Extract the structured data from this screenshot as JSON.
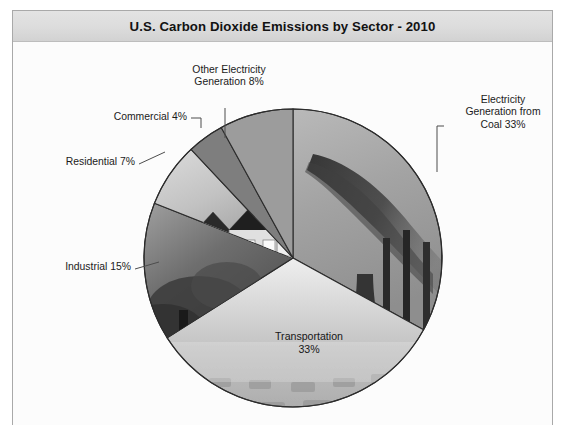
{
  "figure": {
    "title": "U.S. Carbon Dioxide Emissions by Sector - 2010",
    "background_color": "#ffffff",
    "frame_color": "#a9a9a9",
    "title_band_color": "#dcdcdc"
  },
  "chart_data": {
    "type": "pie",
    "title": "U.S. Carbon Dioxide Emissions by Sector - 2010",
    "xlabel": "",
    "ylabel": "",
    "units": "percent",
    "total": 100,
    "legend_position": "none",
    "grid": false,
    "labels": [
      "Electricity Generation from Coal",
      "Transportation",
      "Industrial",
      "Residential",
      "Commercial",
      "Other Electricity Generation"
    ],
    "values": [
      33,
      33,
      15,
      7,
      4,
      8
    ],
    "slices": [
      {
        "name": "Electricity Generation from Coal",
        "value": 33,
        "label_text": "Electricity\nGeneration from\nCoal 33%",
        "label_position": "outside-right",
        "fill": "photo-smokestacks",
        "start_angle_deg": 0,
        "end_angle_deg": 118.8
      },
      {
        "name": "Transportation",
        "value": 33,
        "label_text": "Transportation\n33%",
        "label_position": "inside",
        "fill": "photo-traffic",
        "start_angle_deg": 118.8,
        "end_angle_deg": 237.6
      },
      {
        "name": "Industrial",
        "value": 15,
        "label_text": "Industrial 15%",
        "label_position": "outside-left",
        "fill": "photo-industrial-smoke",
        "start_angle_deg": 237.6,
        "end_angle_deg": 291.6
      },
      {
        "name": "Residential",
        "value": 7,
        "label_text": "Residential 7%",
        "label_position": "outside-left",
        "fill": "photo-houses",
        "start_angle_deg": 291.6,
        "end_angle_deg": 316.8
      },
      {
        "name": "Commercial",
        "value": 4,
        "label_text": "Commercial 4%",
        "label_position": "outside-left",
        "fill": "solid-dark-gray",
        "start_angle_deg": 316.8,
        "end_angle_deg": 331.2
      },
      {
        "name": "Other Electricity Generation",
        "value": 8,
        "label_text": "Other Electricity\nGeneration 8%",
        "label_position": "outside-top",
        "fill": "solid-medium-gray",
        "start_angle_deg": 331.2,
        "end_angle_deg": 360
      }
    ]
  }
}
